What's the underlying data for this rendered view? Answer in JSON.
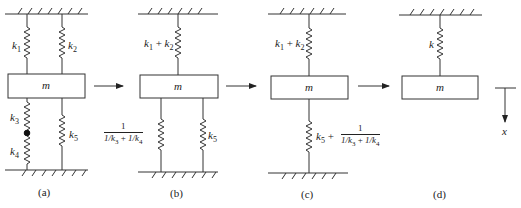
{
  "figure": {
    "colors": {
      "line": "#333333",
      "text": "#222222",
      "background": "#ffffff"
    },
    "panels": [
      {
        "id": "a",
        "caption": "(a)",
        "mass_label": "m",
        "springs": [
          {
            "name": "k1",
            "label": "k",
            "sub": "1",
            "position": "top-left"
          },
          {
            "name": "k2",
            "label": "k",
            "sub": "2",
            "position": "top-right"
          },
          {
            "name": "k3",
            "label": "k",
            "sub": "3",
            "position": "bottom-left-upper"
          },
          {
            "name": "k4",
            "label": "k",
            "sub": "4",
            "position": "bottom-left-lower"
          },
          {
            "name": "k5",
            "label": "k",
            "sub": "5",
            "position": "bottom-right"
          }
        ]
      },
      {
        "id": "b",
        "caption": "(b)",
        "mass_label": "m",
        "top_spring": {
          "k1": "k",
          "s1": "1",
          "plus": " + ",
          "k2": "k",
          "s2": "2"
        },
        "bottom_left_spring": {
          "num": "1",
          "den_a": "1/k",
          "den_a_sub": "3",
          "den_plus": " + ",
          "den_b": "1/k",
          "den_b_sub": "4"
        },
        "bottom_right_spring": {
          "label": "k",
          "sub": "5"
        }
      },
      {
        "id": "c",
        "caption": "(c)",
        "mass_label": "m",
        "top_spring": {
          "k1": "k",
          "s1": "1",
          "plus": " + ",
          "k2": "k",
          "s2": "2"
        },
        "bottom_spring": {
          "k": "k",
          "sub": "5",
          "plus": " + ",
          "num": "1",
          "den_a": "1/k",
          "den_a_sub": "3",
          "den_plus": " + ",
          "den_b": "1/k",
          "den_b_sub": "4"
        }
      },
      {
        "id": "d",
        "caption": "(d)",
        "mass_label": "m",
        "spring": {
          "label": "k"
        },
        "axis_label": "x"
      }
    ]
  }
}
